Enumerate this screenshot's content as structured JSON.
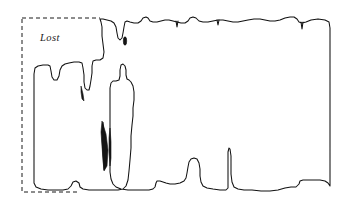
{
  "figure": {
    "name": "occupancy-map-sketch",
    "background_color": "#ffffff",
    "width": 349,
    "height": 210
  },
  "annotations": {
    "region_label": "Lost"
  },
  "lost_region": {
    "label": "Lost",
    "stroke_color": "#1a1a1a",
    "style": "dashed",
    "dash_pattern": "4 3",
    "bounds": {
      "x": 22,
      "y": 18,
      "width": 308,
      "height": 174
    }
  },
  "map": {
    "stroke_color": "#111111",
    "stroke_width": 1.05,
    "wall_outline_path": "M 100 19 L 101 22 L 102 27 L 102 36 L 103 44 L 104 52 L 103 58 L 100 60 L 96 60 L 93 61 L 92 66 L 92 73 L 91 80 L 90 86 L 89 90 L 87 90 L 85 88 L 84 82 L 84 75 L 83 68 L 82 63 L 79 62 L 74 62 L 69 63 L 65 64 L 62 66 L 60 70 L 59 76 L 57 80 L 54 80 L 52 77 L 51 71 L 50 66 L 48 65 L 43 65 L 38 66 L 35 68 L 34 74 L 34 84 L 34 96 L 34 110 L 34 124 L 34 138 L 34 152 L 34 166 L 34 176 L 34 183 L 36 187 L 41 189 L 48 190 L 56 190 L 63 190 L 68 189 L 71 186 L 73 182 L 76 181 L 79 183 L 80 187 L 83 189 L 89 190 L 97 190 L 105 190 L 112 190 L 118 190 L 123 189 L 126 186 L 128 180 L 129 171 L 130 160 L 131 148 L 131 136 L 132 125 L 133 116 L 133 108 L 134 100 L 134 92 L 133 86 L 131 82 L 129 80 L 127 79 L 126 75 L 126 70 L 125 66 L 123 64 L 121 65 L 120 70 L 120 76 L 119 80 L 116 81 L 113 81 L 111 83 L 110 88 L 110 96 L 110 106 L 110 118 L 110 130 L 110 142 L 110 153 L 110 163 L 110 172 L 111 179 L 113 184 L 116 187 L 121 189 L 128 190 L 136 190 L 143 190 L 149 190 L 153 189 L 155 187 L 156 183 L 157 181 L 160 181 L 163 182 L 166 183 L 170 184 L 175 184 L 180 183 L 184 181 L 186 178 L 187 173 L 188 167 L 189 162 L 191 159 L 194 158 L 197 159 L 199 163 L 200 169 L 200 176 L 201 182 L 203 186 L 207 188 L 213 189 L 220 190 L 226 190 L 228 188 L 228 180 L 228 170 L 228 160 L 228 152 L 229 148 L 230 149 L 231 156 L 231 165 L 231 174 L 232 182 L 234 187 L 238 189 L 244 190 L 252 190 L 261 191 L 270 191 L 278 190 L 285 188 L 291 187 L 296 187 L 299 184 L 300 181 L 303 180 L 308 180 L 314 180 L 320 180 L 325 181 L 328 183 L 330 186 L 330 178 L 330 166 L 330 152 L 330 138 L 330 124 L 330 110 L 330 96 L 330 82 L 330 68 L 330 54 L 330 40 L 330 28 L 329 22 L 325 20 L 318 19 L 311 20 L 306 22 L 302 23 L 299 22 L 297 19 L 294 17 L 290 17 L 285 18 L 280 20 L 275 21 L 270 21 L 265 20 L 260 19 L 254 19 L 248 20 L 243 21 L 238 22 L 233 22 L 228 21 L 223 20 L 218 20 L 213 21 L 208 22 L 203 22 L 199 21 L 196 18 L 193 17 L 190 18 L 188 21 L 185 23 L 181 23 L 177 22 L 173 21 L 169 20 L 165 20 L 161 21 L 157 22 L 153 22 L 150 21 L 148 18 L 146 17 L 143 18 L 141 21 L 138 23 L 134 23 L 130 22 L 127 21 L 125 22 L 124 27 L 123 33 L 122 38 L 120 40 L 118 38 L 117 33 L 116 27 L 114 23 L 111 21 L 107 20 L 103 19 Z",
    "top_notch_marks": [
      {
        "x": 177,
        "y": 21,
        "depth": 5
      },
      {
        "x": 218,
        "y": 20,
        "depth": 4
      },
      {
        "x": 302,
        "y": 23,
        "depth": 6
      }
    ],
    "blobs": [
      {
        "name": "upper-sliver",
        "x": 125,
        "y": 41,
        "rx": 1.7,
        "ry": 4.2
      },
      {
        "name": "mid-sliver",
        "x": 105,
        "y": 146,
        "rx": 2.0,
        "ry": 25
      },
      {
        "name": "left-streak",
        "x": 82,
        "y": 94,
        "rx": 1.4,
        "ry": 9
      },
      {
        "name": "right-streak",
        "x": 110,
        "y": 145,
        "rx": 1.2,
        "ry": 20
      }
    ]
  }
}
